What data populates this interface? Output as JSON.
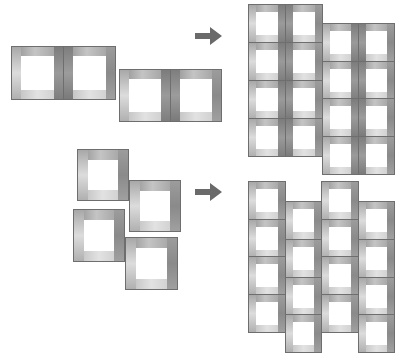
{
  "diagram": {
    "colors": {
      "frame_dark": "#7c7c7c",
      "frame_mid": "#a8a8a8",
      "frame_light": "#e2e2e2",
      "outline": "#6e6e6e",
      "arrow": "#6a6a6a",
      "background": "#ffffff"
    },
    "rows": [
      {
        "name": "paired-tiles-row",
        "input": [
          {
            "x": 11,
            "y": 46,
            "w": 53,
            "h": 54,
            "bar": 9,
            "variant": "pair-left"
          },
          {
            "x": 63,
            "y": 46,
            "w": 53,
            "h": 54,
            "bar": 9,
            "variant": "pair-right"
          },
          {
            "x": 119,
            "y": 69,
            "w": 52,
            "h": 53,
            "bar": 9,
            "variant": "pair-left"
          },
          {
            "x": 170,
            "y": 69,
            "w": 52,
            "h": 53,
            "bar": 9,
            "variant": "pair-right"
          }
        ],
        "arrow": {
          "x": 195,
          "y": 27,
          "w": 27,
          "h": 18
        },
        "output": {
          "columns": [
            {
              "x": 248,
              "y": 4,
              "cols": 2,
              "rows": 4,
              "size": 37,
              "h": 38
            },
            {
              "x": 322,
              "y": 23,
              "cols": 2,
              "rows": 4,
              "size": 36,
              "h": 37.5
            }
          ]
        }
      },
      {
        "name": "single-tiles-row",
        "input": [
          {
            "x": 77,
            "y": 149,
            "w": 52,
            "h": 52,
            "bar": 10,
            "variant": "single"
          },
          {
            "x": 129,
            "y": 180,
            "w": 52,
            "h": 52,
            "bar": 10,
            "variant": "single"
          },
          {
            "x": 73,
            "y": 209,
            "w": 52,
            "h": 53,
            "bar": 10,
            "variant": "single"
          },
          {
            "x": 125,
            "y": 237,
            "w": 53,
            "h": 53,
            "bar": 10,
            "variant": "single"
          }
        ],
        "arrow": {
          "x": 195,
          "y": 183,
          "w": 27,
          "h": 18
        },
        "output": {
          "columns": [
            {
              "x": 248,
              "y": 181,
              "cols": 1,
              "rows": 4,
              "size": 37,
              "h": 37.5
            },
            {
              "x": 285,
              "y": 201,
              "cols": 1,
              "rows": 4,
              "size": 36,
              "h": 37.8
            },
            {
              "x": 321,
              "y": 181,
              "cols": 1,
              "rows": 4,
              "size": 37,
              "h": 37.5
            },
            {
              "x": 358,
              "y": 201,
              "cols": 1,
              "rows": 4,
              "size": 36,
              "h": 37.8
            }
          ]
        }
      }
    ]
  }
}
